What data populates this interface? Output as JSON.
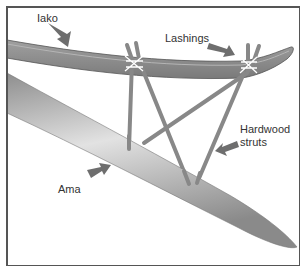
{
  "diagram": {
    "labels": {
      "iako": "Iako",
      "lashings": "Lashings",
      "hardwood_struts_line1": "Hardwood",
      "hardwood_struts_line2": "struts",
      "ama": "Ama"
    },
    "colors": {
      "iako_fill": "#8a8a8a",
      "ama_fill": "#b0b0b0",
      "strut": "#8c8c8c",
      "lashing": "#ffffff",
      "arrow": "#6e6e6e",
      "border": "#555555"
    }
  }
}
